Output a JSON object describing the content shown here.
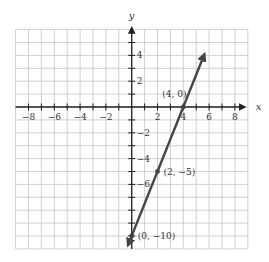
{
  "chart_data": {
    "type": "line",
    "title": "",
    "xlabel": "x",
    "ylabel": "y",
    "xlim": [
      -9,
      9
    ],
    "ylim": [
      -11,
      6
    ],
    "grid": true,
    "x_ticks": [
      -8,
      -6,
      -4,
      -2,
      2,
      4,
      6,
      8
    ],
    "y_ticks": [
      4,
      2,
      -2,
      -4,
      -6
    ],
    "x_tick_labels": [
      "−8",
      "−6",
      "−4",
      "−2",
      "2",
      "4",
      "6",
      "8"
    ],
    "y_tick_labels": [
      "4",
      "2",
      "−2",
      "−4",
      "−6"
    ],
    "series": [
      {
        "name": "y = 2.5x − 10",
        "slope": 2.5,
        "intercept": -10,
        "x_range": [
          -0.3,
          5.65
        ],
        "arrows": "both",
        "color": "#444444"
      }
    ],
    "points": [
      {
        "x": 4,
        "y": 0,
        "label": "(4, 0)"
      },
      {
        "x": 2,
        "y": -5,
        "label": "(2, −5)"
      },
      {
        "x": 0,
        "y": -10,
        "label": "(0, −10)"
      }
    ]
  },
  "colors": {
    "grid": "#c4c4c4",
    "axis": "#222222",
    "line": "#444444",
    "text": "#333333"
  }
}
